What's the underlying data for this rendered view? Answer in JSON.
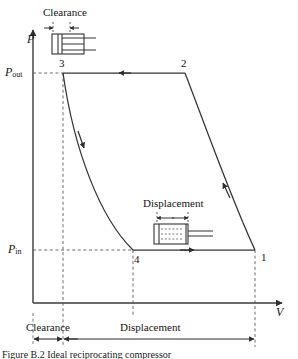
{
  "figure": {
    "type": "pv-diagram",
    "caption": "Figure B.2   Ideal reciprocating compressor",
    "axes": {
      "y_label": "P",
      "y_label_name": "pressure-axis-label",
      "x_label": "V",
      "x_label_name": "volume-axis-label",
      "y_ticks": [
        {
          "label": "P",
          "sub": "out",
          "y": 73
        },
        {
          "label": "P",
          "sub": "in",
          "y": 250
        }
      ]
    },
    "state_points": [
      {
        "id": "1",
        "x": 255,
        "y": 250,
        "label_dx": 6,
        "label_dy": 8
      },
      {
        "id": "2",
        "x": 185,
        "y": 73,
        "label_dx": -2,
        "label_dy": -4
      },
      {
        "id": "3",
        "x": 63,
        "y": 73,
        "label_dx": -2,
        "label_dy": -4
      },
      {
        "id": "4",
        "x": 133,
        "y": 250,
        "label_dx": 3,
        "label_dy": 14
      }
    ],
    "processes": [
      {
        "from": "2",
        "to": "3",
        "name": "discharge",
        "shape": "horizontal",
        "arrow": "left"
      },
      {
        "from": "3",
        "to": "4",
        "name": "re-expansion",
        "shape": "curve",
        "arrow": "down"
      },
      {
        "from": "4",
        "to": "1",
        "name": "suction",
        "shape": "horizontal",
        "arrow": "right"
      },
      {
        "from": "1",
        "to": "2",
        "name": "compression",
        "shape": "curve",
        "arrow": "up-left"
      }
    ],
    "dimensions": [
      {
        "name": "clearance-bottom",
        "label": "Clearance",
        "x1": 33,
        "x2": 63,
        "y": 339,
        "text_x": 30,
        "text_y": 325
      },
      {
        "name": "displacement-bottom",
        "label": "Displacement",
        "x1": 63,
        "x2": 255,
        "y": 339,
        "text_x": 124,
        "text_y": 325
      }
    ],
    "schematics": [
      {
        "name": "clearance-piston-diagram",
        "label": "Clearance",
        "text_x": 47,
        "text_y": 8,
        "dim_y": 27,
        "dim_x1": 53,
        "dim_x2": 70,
        "body_x": 52,
        "body_y": 33,
        "body_w": 39,
        "body_h": 21
      },
      {
        "name": "displacement-piston-diagram",
        "label": "Displacement",
        "text_x": 148,
        "text_y": 200,
        "dim_y": 217,
        "dim_x1": 157,
        "dim_x2": 188,
        "body_x": 154,
        "body_y": 222,
        "body_w": 36,
        "body_h": 21
      }
    ],
    "colors": {
      "line": "#333333",
      "dashed": "#555555",
      "text": "#141414",
      "background": "#ffffff"
    }
  }
}
